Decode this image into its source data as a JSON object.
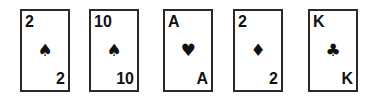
{
  "hand": {
    "cards": [
      {
        "rank": "2",
        "suit": "spades",
        "suit_glyph": "♠"
      },
      {
        "rank": "10",
        "suit": "spades",
        "suit_glyph": "♠"
      },
      {
        "rank": "A",
        "suit": "hearts",
        "suit_glyph": "♥"
      },
      {
        "rank": "2",
        "suit": "diamonds",
        "suit_glyph": "♦"
      },
      {
        "rank": "K",
        "suit": "clubs",
        "suit_glyph": "♣"
      }
    ]
  },
  "colors": {
    "card_border": "#2a2a2a",
    "ink": "#111111",
    "background": "#ffffff"
  }
}
